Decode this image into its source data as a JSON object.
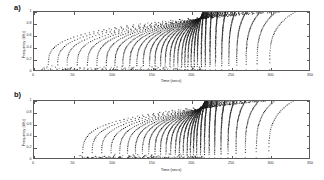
{
  "figure": {
    "background": "#ffffff",
    "ink": "#2b2b2b",
    "axis_color": "#5a5a5a",
    "marker_color": "#1a1a1a"
  },
  "panels": [
    {
      "id": "a",
      "label": "a)",
      "xlabel": "Time (secs)",
      "ylabel": "Frequency (kHz)",
      "xticks": [
        0,
        50,
        100,
        150,
        200,
        250,
        300,
        350
      ],
      "xticklabels": [
        "0",
        "50",
        "100",
        "150",
        "200",
        "250",
        "300",
        "350"
      ],
      "yticks": [
        0,
        0.2,
        0.4,
        0.6,
        0.8,
        1
      ],
      "yticklabels": [
        "0",
        "0.2",
        "0.4",
        "0.6",
        "0.8",
        "1"
      ],
      "xlim": [
        0,
        350
      ],
      "ylim": [
        0,
        1
      ]
    },
    {
      "id": "b",
      "label": "b)",
      "xlabel": "Time (secs)",
      "ylabel": "Frequency (kHz)",
      "xticks": [
        0,
        50,
        100,
        150,
        200,
        250,
        300,
        350
      ],
      "xticklabels": [
        "0",
        "50",
        "100",
        "150",
        "200",
        "250",
        "300",
        "350"
      ],
      "yticks": [
        0,
        0.2,
        0.4,
        0.6,
        0.8,
        1
      ],
      "yticklabels": [
        "0",
        "0.2",
        "0.4",
        "0.6",
        "0.8",
        "1"
      ],
      "xlim": [
        0,
        350
      ],
      "ylim": [
        0,
        1
      ]
    }
  ],
  "chart_data": [
    {
      "type": "scatter",
      "panel": "a",
      "title": "",
      "xlabel": "Time (secs)",
      "ylabel": "Frequency (kHz)",
      "xlim": [
        0,
        350
      ],
      "ylim": [
        0,
        1
      ],
      "grid": false,
      "legend": null,
      "marker": "square",
      "marker_size_px": 1.1,
      "description": "Family of monotonically rising chirp trajectories in the time-frequency plane; each track starts near zero frequency at an early time and sweeps upward to 1 kHz, with track density peaking near t = 200 s.",
      "series": [
        {
          "name": "track-01",
          "t0": 18,
          "t_end": 300,
          "f_end": 1.0,
          "n": 46
        },
        {
          "name": "track-02",
          "t0": 30,
          "t_end": 305,
          "f_end": 1.0,
          "n": 48
        },
        {
          "name": "track-03",
          "t0": 42,
          "t_end": 310,
          "f_end": 1.0,
          "n": 50
        },
        {
          "name": "track-04",
          "t0": 55,
          "t_end": 312,
          "f_end": 1.0,
          "n": 52
        },
        {
          "name": "track-05",
          "t0": 68,
          "t_end": 300,
          "f_end": 1.0,
          "n": 54
        },
        {
          "name": "track-06",
          "t0": 80,
          "t_end": 292,
          "f_end": 1.0,
          "n": 56
        },
        {
          "name": "track-07",
          "t0": 92,
          "t_end": 285,
          "f_end": 1.0,
          "n": 58
        },
        {
          "name": "track-08",
          "t0": 103,
          "t_end": 278,
          "f_end": 1.0,
          "n": 60
        },
        {
          "name": "track-09",
          "t0": 113,
          "t_end": 272,
          "f_end": 1.0,
          "n": 62
        },
        {
          "name": "track-10",
          "t0": 122,
          "t_end": 266,
          "f_end": 1.0,
          "n": 64
        },
        {
          "name": "track-11",
          "t0": 131,
          "t_end": 260,
          "f_end": 1.0,
          "n": 66
        },
        {
          "name": "track-12",
          "t0": 139,
          "t_end": 255,
          "f_end": 1.0,
          "n": 68
        },
        {
          "name": "track-13",
          "t0": 147,
          "t_end": 250,
          "f_end": 1.0,
          "n": 70
        },
        {
          "name": "track-14",
          "t0": 154,
          "t_end": 246,
          "f_end": 1.0,
          "n": 72
        },
        {
          "name": "track-15",
          "t0": 161,
          "t_end": 242,
          "f_end": 1.0,
          "n": 74
        },
        {
          "name": "track-16",
          "t0": 167,
          "t_end": 238,
          "f_end": 1.0,
          "n": 76
        },
        {
          "name": "track-17",
          "t0": 173,
          "t_end": 234,
          "f_end": 1.0,
          "n": 78
        },
        {
          "name": "track-18",
          "t0": 178,
          "t_end": 231,
          "f_end": 1.0,
          "n": 80
        },
        {
          "name": "track-19",
          "t0": 183,
          "t_end": 228,
          "f_end": 1.0,
          "n": 82
        },
        {
          "name": "track-20",
          "t0": 188,
          "t_end": 225,
          "f_end": 1.0,
          "n": 84
        },
        {
          "name": "track-21",
          "t0": 192,
          "t_end": 222,
          "f_end": 1.0,
          "n": 86
        },
        {
          "name": "track-22",
          "t0": 196,
          "t_end": 220,
          "f_end": 1.0,
          "n": 88
        },
        {
          "name": "track-23",
          "t0": 200,
          "t_end": 218,
          "f_end": 1.0,
          "n": 90
        },
        {
          "name": "track-24",
          "t0": 204,
          "t_end": 216,
          "f_end": 1.0,
          "n": 92
        },
        {
          "name": "track-25",
          "t0": 208,
          "t_end": 215,
          "f_end": 1.0,
          "n": 94
        },
        {
          "name": "track-26",
          "t0": 213,
          "t_end": 216,
          "f_end": 1.0,
          "n": 92
        },
        {
          "name": "track-27",
          "t0": 218,
          "t_end": 220,
          "f_end": 1.0,
          "n": 88
        },
        {
          "name": "track-28",
          "t0": 224,
          "t_end": 226,
          "f_end": 1.0,
          "n": 82
        },
        {
          "name": "track-29",
          "t0": 231,
          "t_end": 234,
          "f_end": 1.0,
          "n": 76
        },
        {
          "name": "track-30",
          "t0": 239,
          "t_end": 244,
          "f_end": 1.0,
          "n": 70
        },
        {
          "name": "track-31",
          "t0": 248,
          "t_end": 256,
          "f_end": 1.0,
          "n": 62
        },
        {
          "name": "track-32",
          "t0": 258,
          "t_end": 270,
          "f_end": 1.0,
          "n": 54
        },
        {
          "name": "track-33",
          "t0": 270,
          "t_end": 288,
          "f_end": 1.0,
          "n": 46
        },
        {
          "name": "track-34",
          "t0": 284,
          "t_end": 308,
          "f_end": 1.0,
          "n": 38
        },
        {
          "name": "track-35",
          "t0": 300,
          "t_end": 332,
          "f_end": 1.0,
          "n": 30
        }
      ]
    },
    {
      "type": "scatter",
      "panel": "b",
      "title": "",
      "xlabel": "Time (secs)",
      "ylabel": "Frequency (kHz)",
      "xlim": [
        0,
        350
      ],
      "ylim": [
        0,
        1
      ],
      "grid": false,
      "legend": null,
      "marker": "square",
      "marker_size_px": 1.1,
      "description": "Same chirp-track family as panel a) but the bank is shifted toward later start times; tracks are absent from the left third of the axis and the densest cluster sits near t = 205 s.",
      "series": [
        {
          "name": "track-01",
          "t0": 62,
          "t_end": 290,
          "f_end": 1.0,
          "n": 44
        },
        {
          "name": "track-02",
          "t0": 74,
          "t_end": 292,
          "f_end": 1.0,
          "n": 46
        },
        {
          "name": "track-03",
          "t0": 86,
          "t_end": 294,
          "f_end": 1.0,
          "n": 48
        },
        {
          "name": "track-04",
          "t0": 98,
          "t_end": 292,
          "f_end": 1.0,
          "n": 50
        },
        {
          "name": "track-05",
          "t0": 109,
          "t_end": 288,
          "f_end": 1.0,
          "n": 53
        },
        {
          "name": "track-06",
          "t0": 119,
          "t_end": 282,
          "f_end": 1.0,
          "n": 56
        },
        {
          "name": "track-07",
          "t0": 129,
          "t_end": 275,
          "f_end": 1.0,
          "n": 59
        },
        {
          "name": "track-08",
          "t0": 138,
          "t_end": 268,
          "f_end": 1.0,
          "n": 62
        },
        {
          "name": "track-09",
          "t0": 146,
          "t_end": 262,
          "f_end": 1.0,
          "n": 65
        },
        {
          "name": "track-10",
          "t0": 154,
          "t_end": 256,
          "f_end": 1.0,
          "n": 68
        },
        {
          "name": "track-11",
          "t0": 161,
          "t_end": 250,
          "f_end": 1.0,
          "n": 71
        },
        {
          "name": "track-12",
          "t0": 168,
          "t_end": 245,
          "f_end": 1.0,
          "n": 74
        },
        {
          "name": "track-13",
          "t0": 174,
          "t_end": 240,
          "f_end": 1.0,
          "n": 77
        },
        {
          "name": "track-14",
          "t0": 180,
          "t_end": 236,
          "f_end": 1.0,
          "n": 80
        },
        {
          "name": "track-15",
          "t0": 185,
          "t_end": 232,
          "f_end": 1.0,
          "n": 83
        },
        {
          "name": "track-16",
          "t0": 190,
          "t_end": 228,
          "f_end": 1.0,
          "n": 86
        },
        {
          "name": "track-17",
          "t0": 195,
          "t_end": 225,
          "f_end": 1.0,
          "n": 89
        },
        {
          "name": "track-18",
          "t0": 199,
          "t_end": 222,
          "f_end": 1.0,
          "n": 91
        },
        {
          "name": "track-19",
          "t0": 203,
          "t_end": 220,
          "f_end": 1.0,
          "n": 93
        },
        {
          "name": "track-20",
          "t0": 207,
          "t_end": 218,
          "f_end": 1.0,
          "n": 94
        },
        {
          "name": "track-21",
          "t0": 212,
          "t_end": 218,
          "f_end": 1.0,
          "n": 92
        },
        {
          "name": "track-22",
          "t0": 217,
          "t_end": 221,
          "f_end": 1.0,
          "n": 88
        },
        {
          "name": "track-23",
          "t0": 223,
          "t_end": 226,
          "f_end": 1.0,
          "n": 83
        },
        {
          "name": "track-24",
          "t0": 230,
          "t_end": 233,
          "f_end": 1.0,
          "n": 77
        },
        {
          "name": "track-25",
          "t0": 238,
          "t_end": 243,
          "f_end": 1.0,
          "n": 70
        },
        {
          "name": "track-26",
          "t0": 247,
          "t_end": 255,
          "f_end": 1.0,
          "n": 62
        },
        {
          "name": "track-27",
          "t0": 257,
          "t_end": 269,
          "f_end": 1.0,
          "n": 54
        },
        {
          "name": "track-28",
          "t0": 269,
          "t_end": 286,
          "f_end": 1.0,
          "n": 45
        },
        {
          "name": "track-29",
          "t0": 283,
          "t_end": 306,
          "f_end": 1.0,
          "n": 36
        },
        {
          "name": "track-30",
          "t0": 299,
          "t_end": 330,
          "f_end": 1.0,
          "n": 28
        }
      ]
    }
  ]
}
